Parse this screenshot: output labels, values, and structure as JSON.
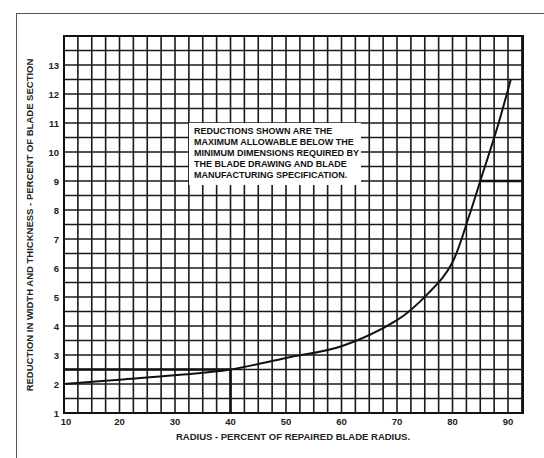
{
  "chart_data": {
    "type": "line",
    "title": "",
    "xlabel": "RADIUS - PERCENT OF REPAIRED BLADE RADIUS.",
    "ylabel": "REDUCTION IN WIDTH AND THICKNESS - PERCENT OF BLADE SECTION",
    "xlim": [
      10,
      92.7
    ],
    "ylim": [
      1,
      14
    ],
    "x_ticks": [
      "10",
      "20",
      "30",
      "40",
      "50",
      "60",
      "70",
      "80",
      "90"
    ],
    "y_ticks": [
      "1",
      "2",
      "3",
      "4",
      "5",
      "6",
      "7",
      "8",
      "9",
      "10",
      "11",
      "12",
      "13"
    ],
    "grid": true,
    "grid_x_step": 2.5,
    "grid_y_step": 0.5,
    "legend": null,
    "annotation": [
      "REDUCTIONS SHOWN ARE THE",
      "MAXIMUM ALLOWABLE BELOW THE",
      "MINIMUM DIMENSIONS REQUIRED BY",
      "THE BLADE DRAWING AND BLADE",
      "MANUFACTURING SPECIFICATION."
    ],
    "series": [
      {
        "name": "Maximum allowable reduction",
        "x": [
          10,
          20,
          30,
          40,
          50,
          60,
          70,
          76,
          80,
          83,
          85,
          88,
          90.5
        ],
        "y": [
          2.0,
          2.15,
          2.3,
          2.5,
          2.9,
          3.3,
          4.2,
          5.2,
          6.2,
          7.8,
          9.0,
          10.8,
          12.5
        ]
      }
    ],
    "reference_lines": [
      {
        "type": "horizontal",
        "y": 2.5,
        "x_from": 10,
        "x_to": 40
      },
      {
        "type": "vertical",
        "x": 40,
        "y_from": 1,
        "y_to": 2.5
      },
      {
        "type": "horizontal",
        "y": 9,
        "x_from": 85,
        "x_to": 92.7
      }
    ]
  }
}
